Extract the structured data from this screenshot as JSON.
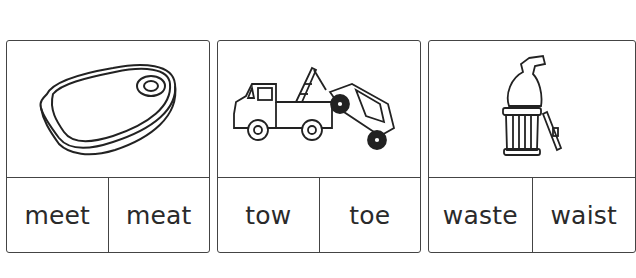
{
  "cards": [
    {
      "picture": "steak-icon",
      "words": [
        "meet",
        "meat"
      ]
    },
    {
      "picture": "tow-truck-icon",
      "words": [
        "tow",
        "toe"
      ]
    },
    {
      "picture": "trash-can-icon",
      "words": [
        "waste",
        "waist"
      ]
    }
  ]
}
